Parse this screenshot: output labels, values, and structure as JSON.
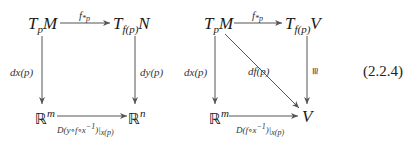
{
  "equation_number": "(2.2.4)",
  "left_diagram": {
    "top_left": {
      "base": "T",
      "sub": "p",
      "main": "M"
    },
    "top_right": {
      "base": "T",
      "sub": "f(p)",
      "main": "N"
    },
    "bottom_left": {
      "base": "ℝ",
      "sup": "m"
    },
    "bottom_right": {
      "base": "ℝ",
      "sup": "n"
    },
    "top_arrow_label": {
      "base": "f",
      "sub": "*p"
    },
    "left_arrow_label": "dx(p)",
    "right_arrow_label": "dy(p)",
    "bottom_arrow_label": {
      "main": "D(y∘f∘x",
      "sup": "−1",
      "close": ")|",
      "sub": "x(p)"
    }
  },
  "right_diagram": {
    "top_left": {
      "base": "T",
      "sub": "p",
      "main": "M"
    },
    "top_right": {
      "base": "T",
      "sub": "f(p)",
      "main": "V"
    },
    "bottom_left": {
      "base": "ℝ",
      "sup": "m"
    },
    "bottom_right": {
      "main": "V"
    },
    "top_arrow_label": {
      "base": "f",
      "sub": "*p"
    },
    "left_arrow_label": "dx(p)",
    "diagonal_arrow_label": "df(p)",
    "right_arrow_label": "≅",
    "bottom_arrow_label": {
      "main": "D(f∘x",
      "sup": "−1",
      "close": ")|",
      "sub": "x(p)"
    }
  },
  "colors": {
    "stroke": "#555555",
    "text": "#1a1a1a"
  }
}
